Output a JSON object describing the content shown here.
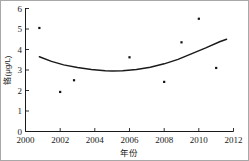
{
  "chart_data": {
    "type": "scatter",
    "title": "",
    "xlabel": "年份",
    "ylabel": "铬(μg/L)",
    "xlim": [
      2000,
      2012
    ],
    "ylim": [
      0,
      6
    ],
    "grid": false,
    "legend": "none",
    "x_ticks": [
      "2000",
      "2002",
      "2004",
      "2006",
      "2008",
      "2010",
      "2012"
    ],
    "y_ticks": [
      "0",
      "1",
      "2",
      "3",
      "4",
      "5",
      "6"
    ],
    "x": [
      2000.8,
      2002.0,
      2002.8,
      2006.0,
      2008.0,
      2009.0,
      2010.0,
      2011.0
    ],
    "values": [
      5.05,
      1.93,
      2.5,
      3.62,
      2.42,
      4.35,
      5.5,
      3.1
    ],
    "points": [
      {
        "x": 2000.8,
        "y": 5.05
      },
      {
        "x": 2002.0,
        "y": 1.93
      },
      {
        "x": 2002.8,
        "y": 2.5
      },
      {
        "x": 2006.0,
        "y": 3.62
      },
      {
        "x": 2008.0,
        "y": 2.42
      },
      {
        "x": 2009.0,
        "y": 4.35
      },
      {
        "x": 2010.0,
        "y": 5.5
      },
      {
        "x": 2011.0,
        "y": 3.1
      }
    ],
    "fit_curve": {
      "name": "quadratic-trend",
      "x": [
        2000.8,
        2001.5,
        2002.2,
        2003.0,
        2003.8,
        2004.6,
        2005.0,
        2005.6,
        2006.4,
        2007.2,
        2008.0,
        2008.8,
        2009.6,
        2010.4,
        2011.2,
        2011.6
      ],
      "y": [
        3.65,
        3.42,
        3.25,
        3.12,
        3.02,
        2.96,
        2.95,
        2.96,
        3.02,
        3.13,
        3.3,
        3.52,
        3.8,
        4.08,
        4.38,
        4.5
      ]
    },
    "marker_color": "#111111",
    "curve_color": "#1a1a1a",
    "axis_color": "#1a1a1a"
  }
}
